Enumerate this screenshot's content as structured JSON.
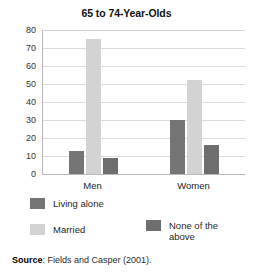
{
  "chart_data": {
    "type": "bar",
    "title": "65 to 74-Year-Olds",
    "xlabel": "",
    "ylabel": "",
    "ylim": [
      0,
      80
    ],
    "yticks": [
      0,
      10,
      20,
      30,
      40,
      50,
      60,
      70,
      80
    ],
    "grid": true,
    "legend_position": "bottom",
    "categories": [
      "Men",
      "Women"
    ],
    "series": [
      {
        "name": "Living alone",
        "color": "#757575",
        "values": [
          13,
          30
        ]
      },
      {
        "name": "Married",
        "color": "#d3d3d3",
        "values": [
          75,
          52
        ]
      },
      {
        "name": "None of the above",
        "color": "#6e6e6e",
        "values": [
          9,
          16
        ]
      }
    ]
  },
  "legend": {
    "items": [
      {
        "label": "Living alone"
      },
      {
        "label": "Married"
      },
      {
        "label": "None of the\nabove"
      }
    ]
  },
  "source": {
    "label": "Source",
    "separator": ":",
    "text": "Fields and Casper (2001)."
  }
}
